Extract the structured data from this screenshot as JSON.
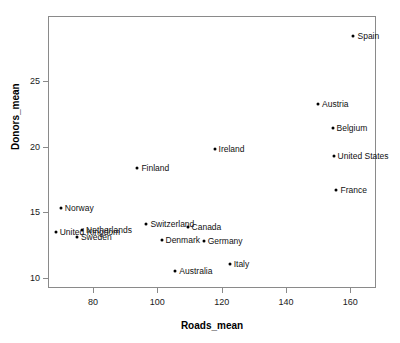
{
  "chart_data": {
    "type": "scatter",
    "title": "",
    "xlabel": "Roads_mean",
    "ylabel": "Donors_mean",
    "xlim": [
      66,
      168
    ],
    "ylim": [
      9.2,
      30.0
    ],
    "grid": false,
    "legend": "none",
    "xticks": [
      80,
      100,
      120,
      140,
      160
    ],
    "xtick_labels": [
      "80",
      "100",
      "120",
      "140",
      "160"
    ],
    "yticks": [
      10,
      15,
      20,
      25
    ],
    "ytick_labels": [
      "10",
      "15",
      "20",
      "25"
    ],
    "point_color": "#000000",
    "frame_color": "#8a8a8a",
    "points": [
      {
        "label": "Spain",
        "x": 161.0,
        "y": 28.5,
        "label_side": "right"
      },
      {
        "label": "Austria",
        "x": 150.0,
        "y": 23.3,
        "label_side": "right"
      },
      {
        "label": "Belgium",
        "x": 154.5,
        "y": 21.4,
        "label_side": "right"
      },
      {
        "label": "United States",
        "x": 154.8,
        "y": 19.3,
        "label_side": "right"
      },
      {
        "label": "France",
        "x": 155.7,
        "y": 16.7,
        "label_side": "right"
      },
      {
        "label": "Ireland",
        "x": 117.8,
        "y": 19.8,
        "label_side": "right"
      },
      {
        "label": "Finland",
        "x": 93.8,
        "y": 18.4,
        "label_side": "right"
      },
      {
        "label": "Norway",
        "x": 70.0,
        "y": 15.3,
        "label_side": "right"
      },
      {
        "label": "Switzerland",
        "x": 96.6,
        "y": 14.1,
        "label_side": "right"
      },
      {
        "label": "Canada",
        "x": 109.4,
        "y": 13.9,
        "label_side": "right"
      },
      {
        "label": "United Kingdom",
        "x": 68.4,
        "y": 13.5,
        "label_side": "right"
      },
      {
        "label": "Netherlands",
        "x": 76.6,
        "y": 13.6,
        "label_side": "right"
      },
      {
        "label": "Sweden",
        "x": 75.0,
        "y": 13.1,
        "label_side": "right"
      },
      {
        "label": "Denmark",
        "x": 101.3,
        "y": 12.9,
        "label_side": "right"
      },
      {
        "label": "Germany",
        "x": 114.4,
        "y": 12.8,
        "label_side": "right"
      },
      {
        "label": "Italy",
        "x": 122.5,
        "y": 11.0,
        "label_side": "right"
      },
      {
        "label": "Australia",
        "x": 105.6,
        "y": 10.5,
        "label_side": "right"
      }
    ]
  }
}
